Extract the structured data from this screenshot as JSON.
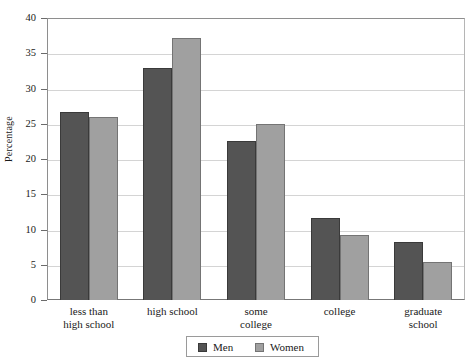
{
  "chart_data": {
    "type": "bar",
    "title": "",
    "xlabel": "",
    "ylabel": "Percentage",
    "ylim": [
      0,
      40
    ],
    "yticks": [
      0,
      5,
      10,
      15,
      20,
      25,
      30,
      35,
      40
    ],
    "ytick_labels": [
      "0",
      "5",
      "10",
      "15",
      "20",
      "25",
      "30",
      "35",
      "40"
    ],
    "grid": true,
    "legend_position": "bottom-center",
    "categories": [
      "less than high school",
      "high school",
      "some college",
      "college",
      "graduate school"
    ],
    "category_lines": [
      [
        "less than",
        "high school"
      ],
      [
        "high school"
      ],
      [
        "some",
        "college"
      ],
      [
        "college"
      ],
      [
        "graduate",
        "school"
      ]
    ],
    "series": [
      {
        "name": "Men",
        "color": "#545454",
        "values": [
          26.7,
          32.9,
          22.5,
          11.6,
          8.2
        ]
      },
      {
        "name": "Women",
        "color": "#a0a0a0",
        "values": [
          25.9,
          37.2,
          24.9,
          9.2,
          5.4
        ]
      }
    ]
  },
  "legend": {
    "items": [
      {
        "label": "Men",
        "swatch": "men-swatch"
      },
      {
        "label": "Women",
        "swatch": "women-swatch"
      }
    ]
  }
}
